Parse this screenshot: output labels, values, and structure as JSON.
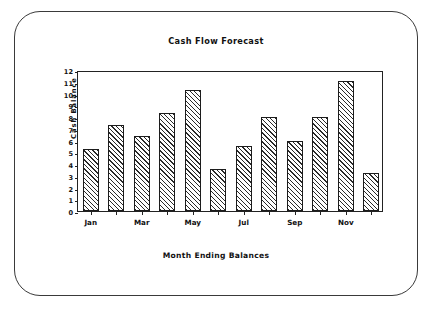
{
  "window": {
    "frame_style": "rounded-crt-bezel",
    "border_color": "#3a3a3a",
    "background_color": "#ffffff"
  },
  "chart_data": {
    "type": "bar",
    "title": "Cash Flow Forecast",
    "xlabel": "Month Ending Balances",
    "ylabel_line1": "Cash Balance",
    "ylabel_line2": "(Thousands)",
    "ylabel": "Cash Balance (Thousands)",
    "categories": [
      "Jan",
      "Feb",
      "Mar",
      "Apr",
      "May",
      "Jun",
      "Jul",
      "Aug",
      "Sep",
      "Oct",
      "Nov",
      "Dec"
    ],
    "values": [
      5.3,
      7.3,
      6.4,
      8.3,
      10.3,
      3.6,
      5.5,
      8.0,
      6.0,
      8.0,
      11.1,
      3.2
    ],
    "x_tick_labels": [
      "Jan",
      "",
      "Mar",
      "",
      "May",
      "",
      "Jul",
      "",
      "Sep",
      "",
      "Nov",
      ""
    ],
    "y_tick_labels": [
      "0",
      "1",
      "2",
      "3",
      "4",
      "5",
      "6",
      "7",
      "8",
      "9",
      "10",
      "11",
      "12"
    ],
    "y_tick_values": [
      0,
      1,
      2,
      3,
      4,
      5,
      6,
      7,
      8,
      9,
      10,
      11,
      12
    ],
    "ylim": [
      0,
      12
    ],
    "grid": false,
    "legend": null,
    "bar_fill": "diagonal-hatch",
    "bar_fill_color": "#2a2a2a",
    "bar_edge_color": "#1c1c1c",
    "bar_background_color": "#ffffff"
  }
}
